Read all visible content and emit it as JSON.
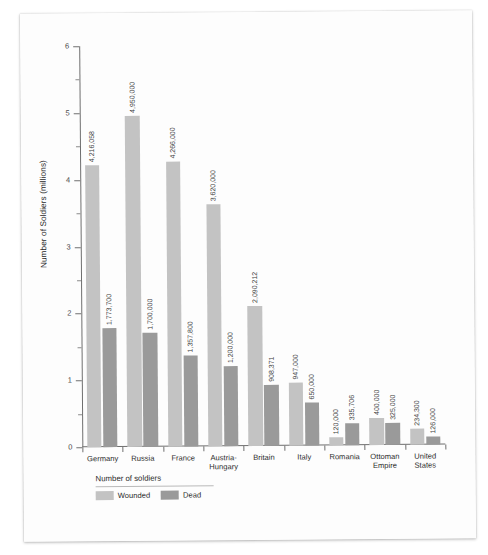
{
  "chart_data": {
    "type": "bar",
    "title": "",
    "xlabel": "",
    "ylabel": "Number of Soldiers (millions)",
    "ylim": [
      0,
      6
    ],
    "ytick_labels": [
      "0",
      "1",
      "2",
      "3",
      "4",
      "5",
      "6"
    ],
    "grid": false,
    "legend_position": "bottom-left",
    "legend_title": "Number of soldiers",
    "categories": [
      "Germany",
      "Russia",
      "France",
      "Austria-\nHungary",
      "Britain",
      "Italy",
      "Romania",
      "Ottoman\nEmpire",
      "United\nStates"
    ],
    "series": [
      {
        "name": "Wounded",
        "color": "#c3c3c3",
        "values": [
          4216058,
          4950000,
          4266000,
          3620000,
          2090212,
          947000,
          120000,
          400000,
          234300
        ],
        "labels": [
          "4,216,058",
          "4,950,000",
          "4,266,000",
          "3,620,000",
          "2,090,212",
          "947,000",
          "120,000",
          "400,000",
          "234,300"
        ]
      },
      {
        "name": "Dead",
        "color": "#9a9a9a",
        "values": [
          1773700,
          1700000,
          1357800,
          1200000,
          908371,
          650000,
          335706,
          325000,
          126000
        ],
        "labels": [
          "1,773,700",
          "1,700,000",
          "1,357,800",
          "1,200,000",
          "908,371",
          "650,000",
          "335,706",
          "325,000",
          "126,000"
        ]
      }
    ]
  }
}
